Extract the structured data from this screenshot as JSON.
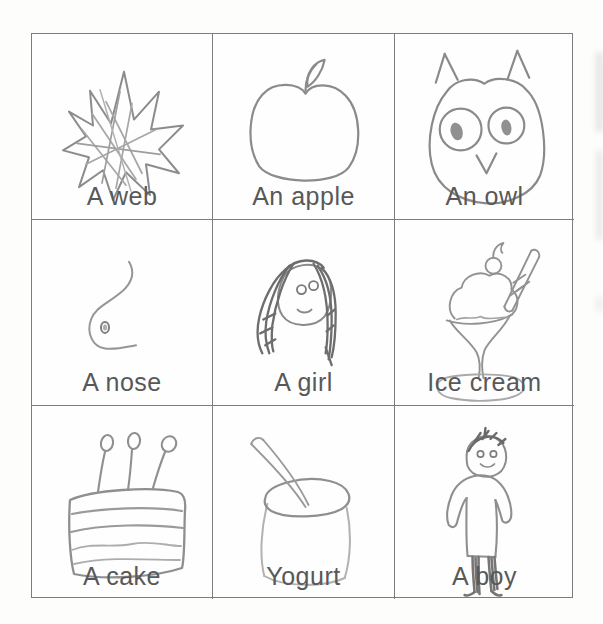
{
  "page": {
    "type": "scanned children's picture dictionary page",
    "background": "#fdfdfc",
    "grid_border_color": "#7d7d7d",
    "label_text_color": "#585858",
    "pencil_color": "#909090",
    "pencil_dark_color": "#6d6d6d",
    "pencil_light_color": "#b2b2b2"
  },
  "cells": [
    {
      "label": "A web",
      "drawing": "web"
    },
    {
      "label": "An apple",
      "drawing": "apple"
    },
    {
      "label": "An owl",
      "drawing": "owl"
    },
    {
      "label": "A nose",
      "drawing": "nose"
    },
    {
      "label": "A girl",
      "drawing": "girl"
    },
    {
      "label": "Ice cream",
      "drawing": "ice-cream"
    },
    {
      "label": "A cake",
      "drawing": "cake"
    },
    {
      "label": "Yogurt",
      "drawing": "yogurt"
    },
    {
      "label": "A boy",
      "drawing": "boy"
    }
  ]
}
